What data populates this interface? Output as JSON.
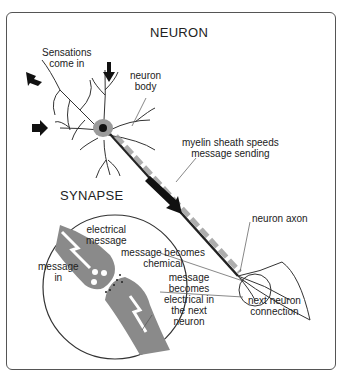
{
  "title": "NEURON",
  "subtitle": "SYNAPSE",
  "labels": {
    "sensations": "Sensations\ncome in",
    "neuron_body": "neuron\nbody",
    "myelin": "myelin sheath speeds\nmessage sending",
    "axon": "neuron axon",
    "next_connection": "next neuron\nconnection",
    "electrical_message": "electrical\nmessage",
    "message_in": "message\nin",
    "becomes_chemical": "message becomes\nchemical",
    "becomes_electrical": "message\nbecomes\nelectrical in\nthe next\nneuron"
  },
  "colors": {
    "ink": "#222222",
    "synapse_fill": "#8a8a8a",
    "sheath": "#9a9a9a"
  }
}
